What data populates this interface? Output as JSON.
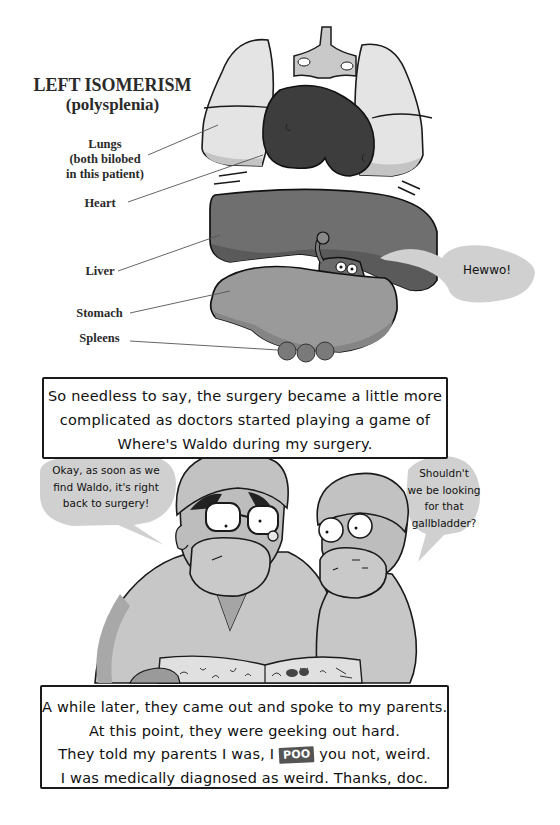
{
  "diagram": {
    "title": "LEFT ISOMERISM",
    "subtitle": "(polysplenia)",
    "labels": {
      "lungs": [
        "Lungs",
        "(both bilobed",
        "in this patient)"
      ],
      "heart": "Heart",
      "liver": "Liver",
      "stomach": "Stomach",
      "spleens": "Spleens"
    },
    "speech_gallbladder": "Hewwo!"
  },
  "caption_top": {
    "lines": [
      "So needless to say, the surgery became a little more",
      "complicated as doctors started playing a game of",
      "Where's Waldo during my surgery."
    ]
  },
  "panel_surgeons": {
    "speech_left": [
      "Okay, as soon as we",
      "find Waldo, it's right",
      "back to surgery!"
    ],
    "speech_right": [
      "Shouldn't",
      "we be looking",
      "for that",
      "gallbladder?"
    ]
  },
  "caption_bottom": {
    "line1": "A while later, they came out and spoke to my parents.",
    "line2": "At this point, they were geeking out hard.",
    "line3_before": "They told my parents I was, I ",
    "line3_badge": "POO",
    "line3_after": " you not, weird.",
    "line4": "I was medically diagnosed as weird. Thanks, doc."
  },
  "colors": {
    "lung": "#e4e4e4",
    "lung_shadow": "#c4c4c4",
    "heart": "#3d3d3d",
    "liver": "#6f6f6f",
    "liver_shadow": "#5a5a5a",
    "stomach": "#9a9a9a",
    "spleen": "#7a7a7a",
    "bubble": "#d0d0d0",
    "skin": "#bdbdbd",
    "scrubs": "#c7c7c7",
    "outline": "#1a1a1a"
  }
}
